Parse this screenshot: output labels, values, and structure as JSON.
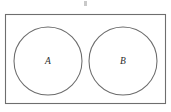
{
  "figure": {
    "title": "",
    "type": "venn-disjoint-sets",
    "universe_label": "",
    "colors": {
      "background": "#ffffff",
      "frame_stroke": "#6e6e6e",
      "circle_stroke": "#6b6b6b",
      "label_text": "#2b2b2b",
      "tick_mark": "#c9c9c9"
    },
    "frame": {
      "name": "universal-set-rectangle",
      "x": 5.5,
      "y": 14.5,
      "width": 160,
      "height": 89
    },
    "sets": [
      {
        "label": "A",
        "name": "set-a",
        "cx": 48,
        "cy": 61,
        "r": 34
      },
      {
        "label": "B",
        "name": "set-b",
        "cx": 123,
        "cy": 61,
        "r": 34
      }
    ],
    "top_mark": {
      "name": "top-tick-mark",
      "x": 84,
      "y": 1,
      "width": 3,
      "height": 5
    }
  }
}
